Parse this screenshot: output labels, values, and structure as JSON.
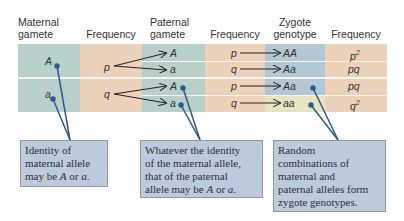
{
  "headers": {
    "maternal_gamete": [
      "Maternal",
      "gamete"
    ],
    "frequency1": "Frequency",
    "paternal_gamete": [
      "Paternal",
      "gamete"
    ],
    "frequency2": "Frequency",
    "zygote_genotype": [
      "Zygote",
      "genotype"
    ],
    "frequency3": "Frequency"
  },
  "maternal": [
    {
      "allele": "A",
      "frequency": "p"
    },
    {
      "allele": "a",
      "frequency": "q"
    }
  ],
  "rows": [
    {
      "paternal_allele": "A",
      "paternal_frequency": "p",
      "genotype": "AA",
      "genotype_frequency": "p",
      "genotype_frequency_exp": "2"
    },
    {
      "paternal_allele": "a",
      "paternal_frequency": "q",
      "genotype": "Aa",
      "genotype_frequency": "pq",
      "genotype_frequency_exp": ""
    },
    {
      "paternal_allele": "A",
      "paternal_frequency": "p",
      "genotype": "Aa",
      "genotype_frequency": "pq",
      "genotype_frequency_exp": ""
    },
    {
      "paternal_allele": "a",
      "paternal_frequency": "q",
      "genotype": "aa",
      "genotype_frequency": "q",
      "genotype_frequency_exp": "2"
    }
  ],
  "callouts": [
    {
      "lines": [
        "Identity of",
        "maternal allele"
      ],
      "last_prefix": "may be ",
      "last_A": "A",
      "last_mid": " or ",
      "last_a": "a",
      "last_suffix": "."
    },
    {
      "lines": [
        "Whatever the identity",
        "of the maternal allele,",
        "that of the paternal"
      ],
      "last_prefix": "allele may be ",
      "last_A": "A",
      "last_mid": " or ",
      "last_a": "a",
      "last_suffix": "."
    },
    {
      "lines": [
        "Random",
        "combinations of",
        "maternal and",
        "paternal alleles form",
        "zygote genotypes."
      ]
    }
  ],
  "colors": {
    "teal": "#b9cfcc",
    "peach": "#ecd2bb",
    "blue": "#b3c7d4",
    "yellow": "#e7e4c4",
    "callout_bg": "#bccad9",
    "leader_line": "#2d5a8a"
  }
}
